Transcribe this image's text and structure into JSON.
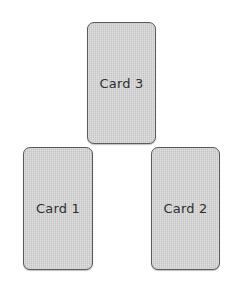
{
  "diagram": {
    "cards": [
      {
        "id": "card-3",
        "label": "Card 3"
      },
      {
        "id": "card-1",
        "label": "Card 1"
      },
      {
        "id": "card-2",
        "label": "Card 2"
      }
    ]
  },
  "colors": {
    "card_fill": "#d4d4d4",
    "card_border": "#5a5a5a",
    "label_text": "#2f2f2f",
    "background": "#ffffff"
  }
}
